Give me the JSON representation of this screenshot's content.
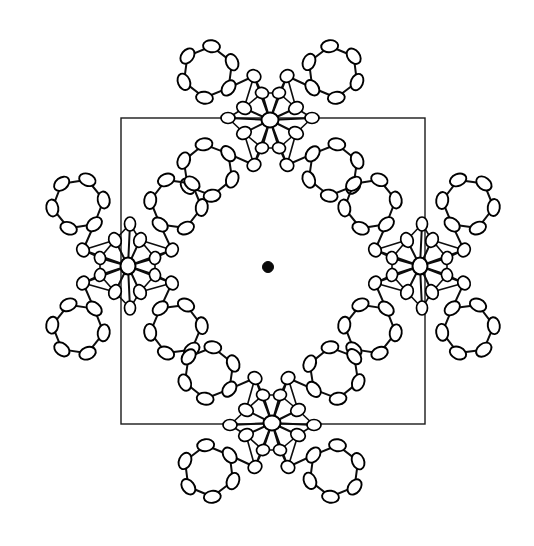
{
  "figure": {
    "caption": "",
    "background_color": "#ffffff",
    "line_color": "#000000",
    "width": 534,
    "height": 546
  },
  "unit_cell": {
    "label": "unit-cell-box",
    "x": 121,
    "y": 118,
    "width": 304,
    "height": 306,
    "stroke": "#1a1a1a",
    "stroke_width": 1.4
  },
  "origin_marker": {
    "label": "cell-center-atom",
    "cx": 268,
    "cy": 267,
    "r": 5.5,
    "color": "#0a0a0a",
    "filled": true
  },
  "molecules": [
    {
      "id": "molecule-top",
      "label": "Cluster at top cell edge midpoint",
      "center_x": 270,
      "center_y": 120,
      "rotation_deg": 0,
      "scale": 1.0
    },
    {
      "id": "molecule-left",
      "label": "Cluster at left cell edge midpoint",
      "center_x": 128,
      "center_y": 266,
      "rotation_deg": 90,
      "scale": 1.0
    },
    {
      "id": "molecule-right",
      "label": "Cluster at right cell edge midpoint",
      "center_x": 420,
      "center_y": 266,
      "rotation_deg": 90,
      "scale": 1.0
    },
    {
      "id": "molecule-bottom",
      "label": "Cluster at bottom cell edge midpoint",
      "center_x": 272,
      "center_y": 423,
      "rotation_deg": 180,
      "scale": 1.0
    }
  ],
  "molecule_template": {
    "description": "Metal center with four phenyl-ring arms drawn as ORTEP thermal ellipsoids",
    "metal": {
      "cx": 0,
      "cy": 0,
      "rx": 8.5,
      "ry": 7.5,
      "angle": 0
    },
    "inner_shell": [
      {
        "cx": -26,
        "cy": -12,
        "rx": 7.5,
        "ry": 6.0,
        "angle": 25
      },
      {
        "cx": 26,
        "cy": -12,
        "rx": 7.5,
        "ry": 6.0,
        "angle": -25
      },
      {
        "cx": -26,
        "cy": 13,
        "rx": 7.5,
        "ry": 6.0,
        "angle": -25
      },
      {
        "cx": 26,
        "cy": 13,
        "rx": 7.5,
        "ry": 6.0,
        "angle": 25
      },
      {
        "cx": -8,
        "cy": -27,
        "rx": 6.5,
        "ry": 5.5,
        "angle": 10
      },
      {
        "cx": 9,
        "cy": -27,
        "rx": 6.5,
        "ry": 5.5,
        "angle": -10
      },
      {
        "cx": -8,
        "cy": 28,
        "rx": 6.5,
        "ry": 5.5,
        "angle": -10
      },
      {
        "cx": 9,
        "cy": 28,
        "rx": 6.5,
        "ry": 5.5,
        "angle": 10
      },
      {
        "cx": -42,
        "cy": -2,
        "rx": 7.0,
        "ry": 5.5,
        "angle": 0
      },
      {
        "cx": 42,
        "cy": -2,
        "rx": 7.0,
        "ry": 5.5,
        "angle": 0
      },
      {
        "cx": -16,
        "cy": -44,
        "rx": 7.0,
        "ry": 6.0,
        "angle": 30
      },
      {
        "cx": 17,
        "cy": -44,
        "rx": 7.0,
        "ry": 6.0,
        "angle": -30
      },
      {
        "cx": -16,
        "cy": 45,
        "rx": 7.0,
        "ry": 6.0,
        "angle": -30
      },
      {
        "cx": 17,
        "cy": 45,
        "rx": 7.0,
        "ry": 6.0,
        "angle": 30
      }
    ],
    "arm_ring_centers": [
      {
        "cx": -62,
        "cy": -48,
        "ring_r": 26,
        "label": "phenyl-upper-left"
      },
      {
        "cx": 63,
        "cy": -48,
        "ring_r": 26,
        "label": "phenyl-upper-right"
      },
      {
        "cx": -62,
        "cy": 50,
        "ring_r": 26,
        "label": "phenyl-lower-left"
      },
      {
        "cx": 63,
        "cy": 50,
        "ring_r": 26,
        "label": "phenyl-lower-right"
      }
    ],
    "ring_ellipsoid_count": 6,
    "ring_ellipsoid_rx": 8.5,
    "ring_ellipsoid_ry": 6.0
  },
  "rendering": {
    "style": "ORTEP thermal ellipsoid plot",
    "ellipsoid_fill": "#ffffff",
    "ellipsoid_stroke": "#000000",
    "bond_stroke": "#0d0d0d"
  }
}
